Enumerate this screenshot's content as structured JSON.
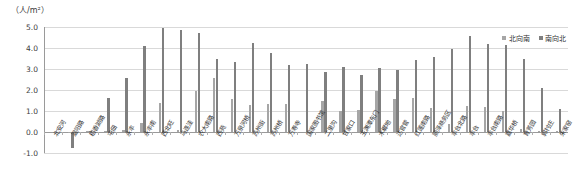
{
  "chart_data": {
    "type": "bar",
    "title": "",
    "subtitle": "",
    "unit_caption": "（人/m²）",
    "xlabel": "",
    "ylabel": "",
    "ylim": [
      -1.0,
      5.0
    ],
    "yticks": [
      "5.0",
      "4.0",
      "3.0",
      "2.0",
      "1.0",
      "0.0",
      "-1.0"
    ],
    "ytick_values": [
      5.0,
      4.0,
      3.0,
      2.0,
      1.0,
      0.0,
      -1.0
    ],
    "grid": true,
    "legend_position": "top-right",
    "categories": [
      "北安河",
      "温阳路",
      "稻香湖路",
      "屯佃",
      "永丰",
      "永丰南",
      "西北旺",
      "马连洼",
      "农大南路",
      "西苑",
      "万泉河桥",
      "苏州街",
      "苏州桥",
      "万寿寺",
      "国家图书馆",
      "二里沟",
      "甘家口",
      "玉渊潭东门",
      "木樨地",
      "达官营",
      "红莲南路",
      "丽泽商务区",
      "丰台北路",
      "丰台",
      "丰台南路",
      "嘉华桥",
      "育芳园",
      "郭村庄",
      "朱家窑"
    ],
    "series": [
      {
        "name": "北向南",
        "color": "#a6a6a6",
        "values": [
          0.0,
          -0.05,
          0.02,
          0.05,
          0.08,
          0.45,
          1.4,
          0.1,
          1.95,
          2.55,
          1.55,
          1.3,
          1.35,
          1.35,
          0.0,
          1.5,
          1.0,
          1.05,
          1.95,
          1.55,
          1.6,
          1.15,
          0.4,
          1.25,
          1.2,
          1.0,
          0.15,
          0.05,
          0.05
        ]
      },
      {
        "name": "南向北",
        "color": "#7f7f7f",
        "values": [
          0.0,
          -0.75,
          0.02,
          1.6,
          2.55,
          4.1,
          4.95,
          4.85,
          4.7,
          3.5,
          3.35,
          4.25,
          3.75,
          3.2,
          3.25,
          2.85,
          3.1,
          2.7,
          3.05,
          2.95,
          3.45,
          3.55,
          3.95,
          4.55,
          4.2,
          4.15,
          3.5,
          2.1,
          1.1
        ]
      }
    ]
  },
  "legend": {
    "items": [
      {
        "label": "北向南",
        "color": "#a6a6a6"
      },
      {
        "label": "南向北",
        "color": "#7f7f7f"
      }
    ]
  }
}
